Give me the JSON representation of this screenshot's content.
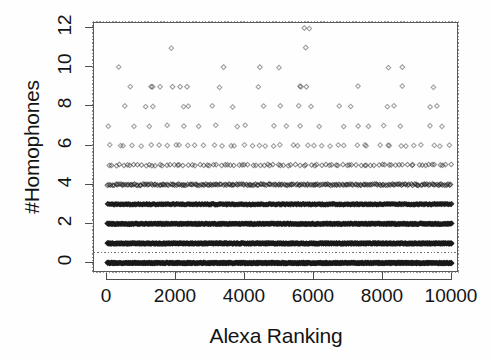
{
  "chart_data": {
    "type": "scatter",
    "title": "",
    "xlabel": "Alexa Ranking",
    "ylabel": "#Homophones",
    "xlim": [
      -200,
      10200
    ],
    "ylim": [
      -0.45,
      12.6
    ],
    "xticks": [
      0,
      2000,
      4000,
      6000,
      8000,
      10000
    ],
    "xtick_labels": [
      "0",
      "2000",
      "4000",
      "6000",
      "8000",
      "10000"
    ],
    "yticks": [
      0,
      2,
      4,
      6,
      8,
      10,
      12
    ],
    "ytick_labels": [
      "0",
      "2",
      "4",
      "6",
      "8",
      "10",
      "12"
    ],
    "grid": false,
    "legend": null,
    "marker": "diamond-open",
    "marker_color": "#1a1a1a",
    "reference_line": {
      "orientation": "horizontal",
      "y": 0.55,
      "style": "dotted",
      "color": "#6e6e6e"
    },
    "level_density": [
      {
        "y": 0,
        "approx_count": 1050,
        "fill": "saturated"
      },
      {
        "y": 1,
        "approx_count": 980,
        "fill": "saturated"
      },
      {
        "y": 2,
        "approx_count": 760,
        "fill": "heavy"
      },
      {
        "y": 3,
        "approx_count": 470,
        "fill": "heavy"
      },
      {
        "y": 4,
        "approx_count": 215,
        "fill": "moderate"
      },
      {
        "y": 5,
        "approx_count": 96,
        "fill": "light"
      },
      {
        "y": 6,
        "approx_count": 44,
        "fill": "sparse"
      },
      {
        "y": 7,
        "approx_count": 20,
        "fill": "sparse"
      },
      {
        "y": 8,
        "approx_count": 17,
        "fill": "sparse"
      },
      {
        "y": 9,
        "approx_count": 8,
        "fill": "sparse"
      },
      {
        "y": 10,
        "approx_count": 3,
        "fill": "sparse"
      },
      {
        "y": 11,
        "approx_count": 1,
        "fill": "sparse"
      },
      {
        "y": 12,
        "approx_count": 1,
        "fill": "sparse"
      }
    ],
    "outliers": [
      {
        "x": 5720,
        "y": 12
      },
      {
        "x": 5760,
        "y": 11
      },
      {
        "x": 3380,
        "y": 10
      },
      {
        "x": 4430,
        "y": 10
      },
      {
        "x": 8560,
        "y": 10
      },
      {
        "x": 1280,
        "y": 9
      },
      {
        "x": 1320,
        "y": 9
      },
      {
        "x": 1900,
        "y": 9
      },
      {
        "x": 2120,
        "y": 9
      },
      {
        "x": 2320,
        "y": 9
      },
      {
        "x": 5620,
        "y": 9
      },
      {
        "x": 5780,
        "y": 9
      }
    ]
  }
}
